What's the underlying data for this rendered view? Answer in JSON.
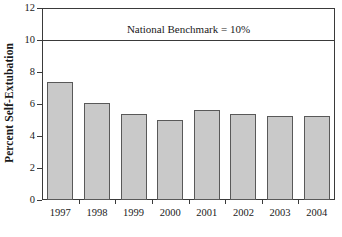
{
  "chart_data": {
    "type": "bar",
    "title": "",
    "xlabel": "",
    "ylabel": "Percent Self-Extubation",
    "categories": [
      "1997",
      "1998",
      "1999",
      "2000",
      "2001",
      "2002",
      "2003",
      "2004"
    ],
    "values": [
      7.35,
      6.05,
      5.35,
      5.0,
      5.6,
      5.4,
      5.25,
      5.25
    ],
    "ylim": [
      0,
      12
    ],
    "yticks": [
      0,
      2,
      4,
      6,
      8,
      10,
      12
    ],
    "ytick_labels": [
      "0",
      "2",
      "4",
      "6",
      "8",
      "10",
      "12"
    ],
    "grid": false,
    "legend": null,
    "annotations": [
      {
        "name": "national-benchmark",
        "label": "National Benchmark = 10%",
        "value": 10,
        "kind": "horizontal-reference-line"
      }
    ],
    "colors": {
      "bar_fill": "#c9c9c9",
      "bar_edge": "#595959",
      "axis": "#3a3a3a",
      "background": "#ffffff",
      "text": "#1a1a1a"
    }
  }
}
